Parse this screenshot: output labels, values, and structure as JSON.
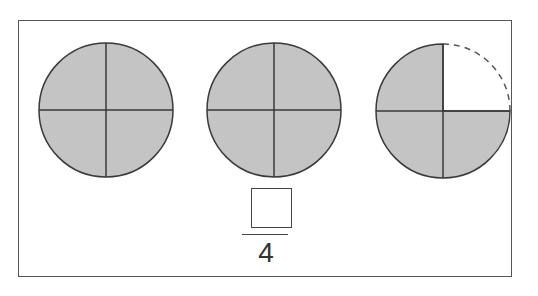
{
  "diagram": {
    "shade_color": "#c4c4c4",
    "stroke_color": "#3a3a3a",
    "circles": [
      {
        "parts": 4,
        "shaded": 4,
        "missing_quarter": null
      },
      {
        "parts": 4,
        "shaded": 4,
        "missing_quarter": null
      },
      {
        "parts": 4,
        "shaded": 3,
        "missing_quarter": "top-right (dashed outline)"
      }
    ],
    "fraction": {
      "numerator": "",
      "numerator_placeholder": "empty answer box",
      "denominator": "4"
    }
  }
}
